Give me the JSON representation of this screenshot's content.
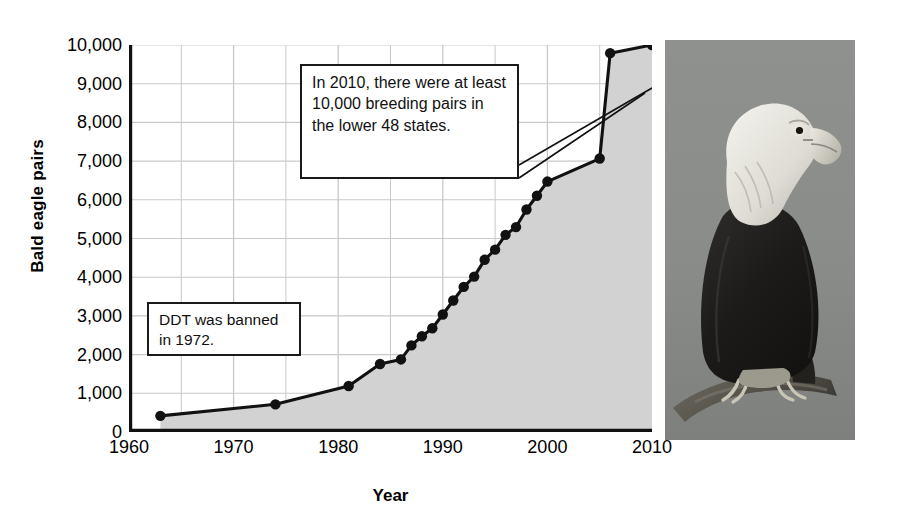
{
  "figure": {
    "title": "",
    "photo_caption": "bald-eagle-perched-on-branch"
  },
  "axes": {
    "ylabel": "Bald eagle pairs",
    "xlabel": "Year",
    "yticks": [
      "0",
      "1,000",
      "2,000",
      "3,000",
      "4,000",
      "5,000",
      "6,000",
      "7,000",
      "8,000",
      "9,000",
      "10,000"
    ],
    "xticks": [
      "1960",
      "1970",
      "1980",
      "1990",
      "2000",
      "2010"
    ]
  },
  "annotations": {
    "callout_2010": "In 2010, there were at least 10,000 breeding pairs in the lower 48 states.",
    "callout_ddt": "DDT was banned in 1972."
  },
  "colors": {
    "line": "#111111",
    "marker": "#111111",
    "fill": "#d2d2d2",
    "grid": "#c9c9c9",
    "axis": "#111111",
    "callout_border": "#1a1a1a",
    "callout_background": "#ffffff",
    "photo_background": "#8d8f8e"
  },
  "chart_data": {
    "type": "line",
    "xlabel": "Year",
    "ylabel": "Bald eagle pairs",
    "xlim": [
      1960,
      2010
    ],
    "ylim": [
      0,
      10000
    ],
    "grid": true,
    "x_major_tick_step": 10,
    "x_gridline_step": 5,
    "y_tick_step": 1000,
    "legend": "none",
    "marker": "filled-circle",
    "area_fill": true,
    "x": [
      1963,
      1974,
      1981,
      1984,
      1986,
      1987,
      1988,
      1989,
      1990,
      1991,
      1992,
      1993,
      1994,
      1995,
      1996,
      1997,
      1998,
      1999,
      2000,
      2005,
      2006,
      2010
    ],
    "y": [
      417,
      715,
      1188,
      1757,
      1875,
      2238,
      2475,
      2680,
      3035,
      3399,
      3749,
      4015,
      4449,
      4712,
      5094,
      5295,
      5748,
      6104,
      6471,
      7066,
      9789,
      10000
    ],
    "series": [
      {
        "name": "Bald eagle breeding pairs",
        "values": [
          417,
          715,
          1188,
          1757,
          1875,
          2238,
          2475,
          2680,
          3035,
          3399,
          3749,
          4015,
          4449,
          4712,
          5094,
          5295,
          5748,
          6104,
          6471,
          7066,
          9789,
          10000
        ]
      }
    ],
    "annotations": [
      {
        "text": "DDT was banned in 1972.",
        "points_to_x": 1974,
        "points_to_y": 715
      },
      {
        "text": "In 2010, there were at least 10,000 breeding pairs in the lower 48 states.",
        "points_to_x": 2010,
        "points_to_y": 10000
      },
      {
        "text": "In 2010, there were at least 10,000 breeding pairs in the lower 48 states.",
        "points_to_x": 2006,
        "points_to_y": 9789
      }
    ]
  }
}
